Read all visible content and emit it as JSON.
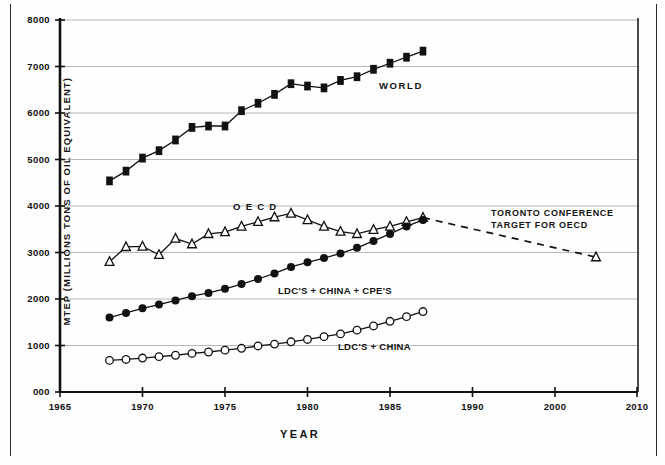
{
  "figure": {
    "y_axis_title": "MTEP (MILLIONS TONS OF OIL EQUIVALENT)",
    "x_axis_title": "YEAR"
  },
  "annotations": {
    "toronto_line1": "TORONTO CONFERENCE",
    "toronto_line2": "TARGET FOR OECD"
  },
  "labels": {
    "world": "WORLD",
    "oecd": "O E C D",
    "ldc_china_cpe": "LDC'S + CHINA + CPE'S",
    "ldc_china": "LDC'S + CHINA"
  },
  "chart_data": {
    "type": "line",
    "title": "",
    "xlabel": "YEAR",
    "ylabel": "MTEP (MILLIONS TONS OF OIL EQUIVALENT)",
    "xlim": [
      1965,
      2010
    ],
    "ylim": [
      0,
      8000
    ],
    "grid": true,
    "legend_position": "inline-labels",
    "x_tick_labels": [
      "1965",
      "1970",
      "1975",
      "1980",
      "1985",
      "1990",
      "2000",
      "2010"
    ],
    "x_tick_values": [
      1965,
      1970,
      1975,
      1980,
      1985,
      1990,
      2000,
      2010
    ],
    "y_tick_labels": [
      "000",
      "1000",
      "2000",
      "3000",
      "4000",
      "5000",
      "6000",
      "7000",
      "8000"
    ],
    "y_tick_values": [
      0,
      1000,
      2000,
      3000,
      4000,
      5000,
      6000,
      7000,
      8000
    ],
    "note_axis_compressed_after": 1990,
    "series": [
      {
        "name": "WORLD",
        "marker": "filled-square",
        "x": [
          1968,
          1969,
          1970,
          1971,
          1972,
          1973,
          1974,
          1975,
          1976,
          1977,
          1978,
          1979,
          1980,
          1981,
          1982,
          1983,
          1984,
          1985,
          1986,
          1987
        ],
        "values": [
          4540,
          4750,
          5030,
          5190,
          5420,
          5690,
          5720,
          5720,
          6050,
          6210,
          6400,
          6630,
          6580,
          6540,
          6700,
          6780,
          6940,
          7070,
          7200,
          7330
        ]
      },
      {
        "name": "O E C D",
        "marker": "open-triangle",
        "x": [
          1968,
          1969,
          1970,
          1971,
          1972,
          1973,
          1974,
          1975,
          1976,
          1977,
          1978,
          1979,
          1980,
          1981,
          1982,
          1983,
          1984,
          1985,
          1986,
          1987
        ],
        "values": [
          2800,
          3120,
          3130,
          2950,
          3300,
          3180,
          3400,
          3440,
          3560,
          3660,
          3760,
          3840,
          3700,
          3560,
          3450,
          3400,
          3490,
          3560,
          3660,
          3750
        ]
      },
      {
        "name": "LDC'S + CHINA + CPE'S",
        "marker": "filled-circle",
        "x": [
          1968,
          1969,
          1970,
          1971,
          1972,
          1973,
          1974,
          1975,
          1976,
          1977,
          1978,
          1979,
          1980,
          1981,
          1982,
          1983,
          1984,
          1985,
          1986,
          1987
        ],
        "values": [
          1600,
          1700,
          1800,
          1880,
          1970,
          2060,
          2130,
          2220,
          2320,
          2430,
          2550,
          2690,
          2790,
          2880,
          2980,
          3100,
          3250,
          3400,
          3560,
          3700
        ]
      },
      {
        "name": "LDC'S + CHINA",
        "marker": "open-circle",
        "x": [
          1968,
          1969,
          1970,
          1971,
          1972,
          1973,
          1974,
          1975,
          1976,
          1977,
          1978,
          1979,
          1980,
          1981,
          1982,
          1983,
          1984,
          1985,
          1986,
          1987
        ],
        "values": [
          680,
          700,
          730,
          760,
          790,
          830,
          860,
          900,
          940,
          990,
          1030,
          1080,
          1130,
          1190,
          1250,
          1330,
          1420,
          1520,
          1620,
          1730
        ]
      },
      {
        "name": "TORONTO CONFERENCE TARGET FOR OECD",
        "marker": "open-triangle",
        "style": "dashed",
        "x": [
          1987,
          2005
        ],
        "values": [
          3750,
          2900
        ]
      }
    ]
  }
}
